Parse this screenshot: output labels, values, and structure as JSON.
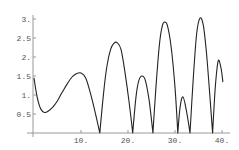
{
  "chart_data": {
    "type": "line",
    "title": "",
    "xlabel": "",
    "ylabel": "",
    "xlim": [
      0,
      40.5
    ],
    "ylim": [
      0,
      3.05
    ],
    "grid": false,
    "legend": null,
    "x_ticks": [
      {
        "value": 10,
        "label": "10."
      },
      {
        "value": 20,
        "label": "20."
      },
      {
        "value": 30,
        "label": "30."
      },
      {
        "value": 40,
        "label": "40."
      }
    ],
    "y_ticks": [
      {
        "value": 0.5,
        "label": "0.5"
      },
      {
        "value": 1,
        "label": "1."
      },
      {
        "value": 1.5,
        "label": "1.5"
      },
      {
        "value": 2,
        "label": "2."
      },
      {
        "value": 2.5,
        "label": "2.5"
      },
      {
        "value": 3,
        "label": "3."
      }
    ],
    "series": [
      {
        "name": "curve",
        "color": "#222222",
        "x": [
          0,
          0.5,
          1.0,
          1.5,
          2.2,
          3.0,
          4.0,
          5.0,
          6.0,
          7.0,
          8.0,
          9.0,
          10.0,
          11.0,
          12.0,
          13.0,
          14.0,
          14.8,
          15.5,
          16.3,
          17.0,
          17.7,
          18.5,
          19.3,
          20.2,
          21.0,
          21.7,
          22.3,
          23.0,
          23.7,
          24.5,
          25.3,
          26.0,
          26.7,
          27.3,
          27.8,
          28.4,
          29.2,
          30.0,
          30.6,
          31.1,
          31.7,
          32.4,
          33.2,
          33.9,
          34.6,
          35.3,
          36.0,
          36.7,
          37.4,
          38.0,
          38.6,
          39.2,
          39.8,
          40.2
        ],
        "y": [
          1.45,
          1.05,
          0.78,
          0.62,
          0.54,
          0.57,
          0.68,
          0.85,
          1.07,
          1.28,
          1.46,
          1.56,
          1.58,
          1.45,
          1.05,
          0.55,
          0.0,
          1.05,
          1.75,
          2.2,
          2.36,
          2.38,
          2.2,
          1.65,
          0.85,
          0.0,
          0.95,
          1.38,
          1.5,
          1.38,
          0.85,
          0.0,
          1.3,
          2.35,
          2.82,
          2.92,
          2.82,
          2.25,
          1.2,
          0.0,
          0.7,
          0.95,
          0.6,
          0.0,
          1.45,
          2.6,
          3.02,
          2.85,
          2.1,
          1.0,
          0.0,
          1.25,
          1.9,
          1.7,
          1.34
        ]
      }
    ]
  }
}
